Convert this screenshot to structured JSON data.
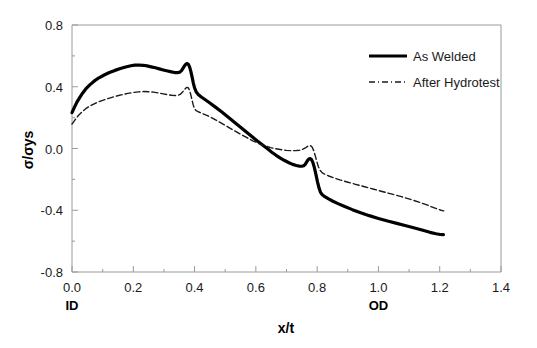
{
  "chart_data": {
    "type": "line",
    "title": "",
    "xlabel": "x/t",
    "ylabel": "σ/σys",
    "xlim": [
      0.0,
      1.4
    ],
    "ylim": [
      -0.8,
      0.8
    ],
    "xticks": [
      "0.0",
      "0.2",
      "0.4",
      "0.6",
      "0.8",
      "1.0",
      "1.2",
      "1.4"
    ],
    "xtick_values": [
      0.0,
      0.2,
      0.4,
      0.6,
      0.8,
      1.0,
      1.2,
      1.4
    ],
    "yticks": [
      "0.8",
      "0.4",
      "0.0",
      "-0.4",
      "-0.8"
    ],
    "ytick_values": [
      0.8,
      0.4,
      0.0,
      -0.4,
      -0.8
    ],
    "grid": false,
    "minor_ticks": true,
    "legend_position": "top-right",
    "axis_annotations": [
      {
        "name": "inner-diameter",
        "label": "ID",
        "x": 0.0
      },
      {
        "name": "outer-diameter",
        "label": "OD",
        "x": 1.0
      }
    ],
    "series": [
      {
        "name": "As Welded",
        "style": "solid",
        "color": "#000000",
        "width": 3.2,
        "points": [
          [
            0.0,
            0.232
          ],
          [
            0.008,
            0.268
          ],
          [
            0.016,
            0.3
          ],
          [
            0.025,
            0.33
          ],
          [
            0.035,
            0.36
          ],
          [
            0.045,
            0.386
          ],
          [
            0.058,
            0.412
          ],
          [
            0.072,
            0.436
          ],
          [
            0.088,
            0.458
          ],
          [
            0.105,
            0.476
          ],
          [
            0.122,
            0.492
          ],
          [
            0.14,
            0.506
          ],
          [
            0.158,
            0.518
          ],
          [
            0.175,
            0.528
          ],
          [
            0.192,
            0.536
          ],
          [
            0.205,
            0.54
          ],
          [
            0.218,
            0.541
          ],
          [
            0.232,
            0.539
          ],
          [
            0.245,
            0.535
          ],
          [
            0.258,
            0.529
          ],
          [
            0.272,
            0.523
          ],
          [
            0.285,
            0.516
          ],
          [
            0.298,
            0.509
          ],
          [
            0.312,
            0.502
          ],
          [
            0.325,
            0.496
          ],
          [
            0.335,
            0.492
          ],
          [
            0.344,
            0.491
          ],
          [
            0.352,
            0.495
          ],
          [
            0.358,
            0.506
          ],
          [
            0.363,
            0.522
          ],
          [
            0.368,
            0.538
          ],
          [
            0.372,
            0.547
          ],
          [
            0.376,
            0.55
          ],
          [
            0.38,
            0.545
          ],
          [
            0.384,
            0.527
          ],
          [
            0.388,
            0.498
          ],
          [
            0.392,
            0.462
          ],
          [
            0.396,
            0.424
          ],
          [
            0.4,
            0.392
          ],
          [
            0.405,
            0.368
          ],
          [
            0.412,
            0.35
          ],
          [
            0.422,
            0.334
          ],
          [
            0.435,
            0.316
          ],
          [
            0.45,
            0.295
          ],
          [
            0.468,
            0.268
          ],
          [
            0.488,
            0.238
          ],
          [
            0.508,
            0.206
          ],
          [
            0.528,
            0.173
          ],
          [
            0.548,
            0.141
          ],
          [
            0.568,
            0.108
          ],
          [
            0.588,
            0.076
          ],
          [
            0.605,
            0.048
          ],
          [
            0.622,
            0.022
          ],
          [
            0.638,
            -0.002
          ],
          [
            0.652,
            -0.024
          ],
          [
            0.666,
            -0.044
          ],
          [
            0.68,
            -0.062
          ],
          [
            0.694,
            -0.078
          ],
          [
            0.708,
            -0.092
          ],
          [
            0.72,
            -0.103
          ],
          [
            0.732,
            -0.11
          ],
          [
            0.742,
            -0.114
          ],
          [
            0.75,
            -0.115
          ],
          [
            0.756,
            -0.112
          ],
          [
            0.761,
            -0.103
          ],
          [
            0.765,
            -0.09
          ],
          [
            0.769,
            -0.077
          ],
          [
            0.773,
            -0.068
          ],
          [
            0.777,
            -0.065
          ],
          [
            0.781,
            -0.07
          ],
          [
            0.786,
            -0.09
          ],
          [
            0.791,
            -0.124
          ],
          [
            0.796,
            -0.168
          ],
          [
            0.801,
            -0.214
          ],
          [
            0.806,
            -0.255
          ],
          [
            0.811,
            -0.284
          ],
          [
            0.817,
            -0.3
          ],
          [
            0.825,
            -0.312
          ],
          [
            0.836,
            -0.325
          ],
          [
            0.85,
            -0.34
          ],
          [
            0.868,
            -0.357
          ],
          [
            0.89,
            -0.376
          ],
          [
            0.915,
            -0.396
          ],
          [
            0.942,
            -0.416
          ],
          [
            0.97,
            -0.435
          ],
          [
            1.0,
            -0.453
          ],
          [
            1.03,
            -0.47
          ],
          [
            1.06,
            -0.485
          ],
          [
            1.09,
            -0.5
          ],
          [
            1.118,
            -0.515
          ],
          [
            1.145,
            -0.53
          ],
          [
            1.168,
            -0.543
          ],
          [
            1.188,
            -0.552
          ],
          [
            1.202,
            -0.557
          ],
          [
            1.212,
            -0.558
          ]
        ]
      },
      {
        "name": "After Hydrotest",
        "style": "dashdot",
        "color": "#1a1a1a",
        "width": 1.4,
        "points": [
          [
            0.0,
            0.158
          ],
          [
            0.01,
            0.186
          ],
          [
            0.02,
            0.212
          ],
          [
            0.032,
            0.236
          ],
          [
            0.045,
            0.258
          ],
          [
            0.06,
            0.277
          ],
          [
            0.076,
            0.293
          ],
          [
            0.093,
            0.307
          ],
          [
            0.11,
            0.319
          ],
          [
            0.128,
            0.33
          ],
          [
            0.146,
            0.34
          ],
          [
            0.164,
            0.349
          ],
          [
            0.182,
            0.357
          ],
          [
            0.2,
            0.363
          ],
          [
            0.218,
            0.367
          ],
          [
            0.234,
            0.369
          ],
          [
            0.25,
            0.368
          ],
          [
            0.266,
            0.365
          ],
          [
            0.282,
            0.36
          ],
          [
            0.298,
            0.354
          ],
          [
            0.312,
            0.349
          ],
          [
            0.325,
            0.345
          ],
          [
            0.336,
            0.343
          ],
          [
            0.346,
            0.345
          ],
          [
            0.354,
            0.352
          ],
          [
            0.36,
            0.364
          ],
          [
            0.366,
            0.378
          ],
          [
            0.371,
            0.39
          ],
          [
            0.375,
            0.396
          ],
          [
            0.379,
            0.394
          ],
          [
            0.383,
            0.38
          ],
          [
            0.387,
            0.354
          ],
          [
            0.391,
            0.32
          ],
          [
            0.395,
            0.287
          ],
          [
            0.399,
            0.262
          ],
          [
            0.404,
            0.247
          ],
          [
            0.412,
            0.238
          ],
          [
            0.424,
            0.228
          ],
          [
            0.44,
            0.215
          ],
          [
            0.458,
            0.197
          ],
          [
            0.478,
            0.175
          ],
          [
            0.5,
            0.15
          ],
          [
            0.522,
            0.124
          ],
          [
            0.545,
            0.098
          ],
          [
            0.568,
            0.073
          ],
          [
            0.59,
            0.05
          ],
          [
            0.61,
            0.032
          ],
          [
            0.63,
            0.017
          ],
          [
            0.648,
            0.006
          ],
          [
            0.666,
            -0.002
          ],
          [
            0.684,
            -0.008
          ],
          [
            0.7,
            -0.012
          ],
          [
            0.716,
            -0.014
          ],
          [
            0.73,
            -0.014
          ],
          [
            0.742,
            -0.011
          ],
          [
            0.752,
            -0.006
          ],
          [
            0.76,
            0.002
          ],
          [
            0.766,
            0.01
          ],
          [
            0.771,
            0.016
          ],
          [
            0.775,
            0.019
          ],
          [
            0.779,
            0.018
          ],
          [
            0.784,
            0.008
          ],
          [
            0.789,
            -0.015
          ],
          [
            0.794,
            -0.048
          ],
          [
            0.799,
            -0.085
          ],
          [
            0.804,
            -0.118
          ],
          [
            0.81,
            -0.143
          ],
          [
            0.817,
            -0.158
          ],
          [
            0.826,
            -0.168
          ],
          [
            0.838,
            -0.178
          ],
          [
            0.854,
            -0.19
          ],
          [
            0.874,
            -0.203
          ],
          [
            0.898,
            -0.217
          ],
          [
            0.925,
            -0.232
          ],
          [
            0.955,
            -0.248
          ],
          [
            0.985,
            -0.264
          ],
          [
            1.015,
            -0.28
          ],
          [
            1.045,
            -0.296
          ],
          [
            1.075,
            -0.312
          ],
          [
            1.105,
            -0.33
          ],
          [
            1.132,
            -0.347
          ],
          [
            1.156,
            -0.364
          ],
          [
            1.176,
            -0.38
          ],
          [
            1.192,
            -0.392
          ],
          [
            1.204,
            -0.4
          ],
          [
            1.213,
            -0.404
          ]
        ]
      }
    ]
  },
  "legend": {
    "items": [
      {
        "label": "As Welded",
        "style": "solid"
      },
      {
        "label": "After Hydrotest",
        "style": "dashdot"
      }
    ]
  }
}
